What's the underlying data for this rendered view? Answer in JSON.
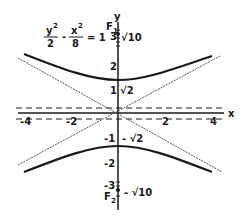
{
  "diagram": {
    "type": "hyperbola-graph",
    "equation": {
      "term1_num": "y",
      "term1_exp": "2",
      "term1_den": "2",
      "minus": "-",
      "term2_num": "x",
      "term2_exp": "2",
      "term2_den": "8",
      "equals": "= 1"
    },
    "axes": {
      "x_label": "x",
      "y_label": "y",
      "x_ticks": [
        "-4",
        "-2",
        "2",
        "4"
      ],
      "y_ticks_pos": [
        "3",
        "2",
        "1"
      ],
      "y_ticks_neg": [
        "-1",
        "-2",
        "-3"
      ]
    },
    "foci": {
      "f1_label": "F",
      "f1_sub": "1",
      "f1_value": "√10",
      "f2_label": "F",
      "f2_sub": "2",
      "f2_value": "- √10"
    },
    "vertices": {
      "top_value": "√2",
      "bottom_value": "- √2"
    },
    "colors": {
      "curve": "#1a1a1a",
      "asymptote": "#555555",
      "axis": "#1a1a1a"
    }
  }
}
